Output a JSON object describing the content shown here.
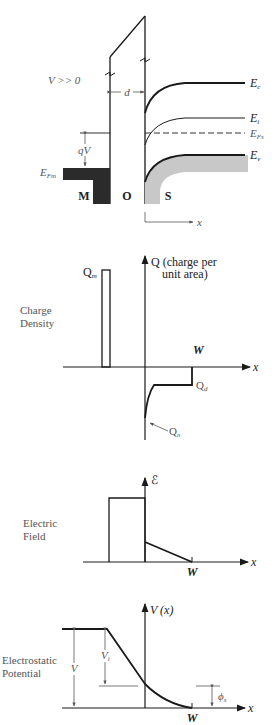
{
  "band_diagram": {
    "bias_label": "V >> 0",
    "oxide_thickness_label": "d",
    "voltage_drop_label": "qV",
    "metal_fermi_label": {
      "main": "E",
      "sub": "Fm"
    },
    "band_labels": {
      "conduction": {
        "main": "E",
        "sub": "c"
      },
      "intrinsic": {
        "main": "E",
        "sub": "i"
      },
      "fermi_semiconductor": {
        "main": "E",
        "sub": "Fs"
      },
      "valence": {
        "main": "E",
        "sub": "v"
      }
    },
    "region_labels": {
      "metal": "M",
      "oxide": "O",
      "semiconductor": "S"
    },
    "x_axis_label": "x"
  },
  "charge_density": {
    "title_line1": "Charge",
    "title_line2": "Density",
    "y_axis_line1": "Q (charge per",
    "y_axis_line2": "unit area)",
    "metal_charge_label": {
      "main": "Q",
      "sub": "m"
    },
    "depletion_charge_label": {
      "main": "Q",
      "sub": "d"
    },
    "inversion_charge_label": {
      "main": "Q",
      "sub": "n"
    },
    "depletion_width_label": "W",
    "x_axis_label": "x"
  },
  "electric_field": {
    "title_line1": "Electric",
    "title_line2": "Field",
    "y_axis_label": "ℰ",
    "depletion_width_label": "W",
    "x_axis_label": "x"
  },
  "electrostatic_potential": {
    "title_line1": "Electrostatic",
    "title_line2": "Potential",
    "y_axis_label": "V (x)",
    "total_voltage_label": "V",
    "oxide_voltage_label": {
      "main": "V",
      "sub": "i"
    },
    "surface_potential_label": {
      "main": "ϕ",
      "sub": "s"
    },
    "depletion_width_label": "W",
    "x_axis_label": "x"
  },
  "colors": {
    "line": "#1a1a1a",
    "metal_fill": "#2b2b2b",
    "valence_fill": "#c8c8c8",
    "label_gray": "#555555"
  }
}
